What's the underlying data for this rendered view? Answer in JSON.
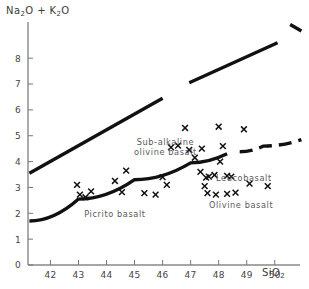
{
  "chart_data": {
    "type": "scatter",
    "title": "",
    "ylabel": "Na2O + K2O",
    "ylabel_parts": [
      "Na",
      "2",
      "O + K",
      "2",
      "O"
    ],
    "xlabel": "SiO2",
    "xlabel_parts": [
      "SiO",
      "2"
    ],
    "xlim": [
      41.2,
      50.9
    ],
    "ylim": [
      0,
      9.4
    ],
    "grid": false,
    "legend": null,
    "xticks": [
      42,
      43,
      44,
      45,
      46,
      47,
      48,
      49,
      50
    ],
    "xtick_labels": [
      "42",
      "43",
      "44",
      "45",
      "46",
      "47",
      "48",
      "49",
      "50"
    ],
    "yticks": [
      0,
      1,
      2,
      3,
      4,
      5,
      6,
      7,
      8
    ],
    "ytick_labels": [
      "0",
      "1",
      "2",
      "3",
      "4",
      "5",
      "6",
      "7",
      "8"
    ],
    "field_labels": [
      {
        "name": "sub-alkaline-olivine-basalt",
        "line1": "Sub-alkaline",
        "line2": "olivine  basalt",
        "x": 46.1,
        "y": 4.65
      },
      {
        "name": "picrito-basalt",
        "line1": "Picrito  basalt",
        "line2": "",
        "x": 44.3,
        "y": 1.85
      },
      {
        "name": "leucobasalt",
        "line1": "Leucobasalt",
        "line2": "",
        "x": 48.9,
        "y": 3.25
      },
      {
        "name": "olivine-basalt",
        "line1": "Olivine  basalt",
        "line2": "",
        "x": 48.8,
        "y": 2.2
      }
    ],
    "boundaries": [
      {
        "name": "upper-alkaline-boundary-lower",
        "style": "solid",
        "points": [
          [
            41.25,
            3.55
          ],
          [
            46.0,
            6.45
          ]
        ]
      },
      {
        "name": "upper-alkaline-boundary-upper",
        "style": "solid",
        "points": [
          [
            46.95,
            7.05
          ],
          [
            50.1,
            8.6
          ]
        ]
      },
      {
        "name": "upper-alkaline-boundary-top",
        "style": "solid",
        "points": [
          [
            50.55,
            9.3
          ],
          [
            50.95,
            9.05
          ]
        ]
      },
      {
        "name": "lower-alkaline-boundary-solid",
        "style": "solid",
        "points": [
          [
            41.25,
            1.7
          ],
          [
            43.0,
            2.55
          ],
          [
            45.0,
            3.3
          ],
          [
            47.0,
            3.95
          ],
          [
            48.3,
            4.3
          ]
        ]
      },
      {
        "name": "lower-alkaline-boundary-dashed",
        "style": "dashed",
        "points": [
          [
            48.75,
            4.38
          ],
          [
            49.6,
            4.6
          ],
          [
            50.95,
            4.85
          ]
        ]
      }
    ],
    "series": [
      {
        "name": "analyses",
        "marker": "x",
        "points": [
          [
            42.95,
            3.1
          ],
          [
            43.05,
            2.72
          ],
          [
            43.45,
            2.85
          ],
          [
            43.25,
            2.62
          ],
          [
            44.3,
            3.25
          ],
          [
            44.55,
            2.82
          ],
          [
            44.7,
            3.65
          ],
          [
            45.35,
            2.78
          ],
          [
            45.75,
            2.72
          ],
          [
            46.0,
            3.4
          ],
          [
            46.15,
            3.1
          ],
          [
            46.3,
            4.55
          ],
          [
            46.55,
            4.62
          ],
          [
            46.8,
            5.3
          ],
          [
            46.95,
            4.45
          ],
          [
            47.15,
            4.15
          ],
          [
            47.35,
            3.6
          ],
          [
            47.4,
            4.5
          ],
          [
            47.5,
            3.05
          ],
          [
            47.55,
            3.38
          ],
          [
            47.65,
            3.42
          ],
          [
            47.85,
            3.48
          ],
          [
            47.6,
            2.78
          ],
          [
            47.9,
            2.72
          ],
          [
            48.0,
            5.35
          ],
          [
            48.05,
            4.0
          ],
          [
            48.15,
            4.6
          ],
          [
            48.3,
            3.45
          ],
          [
            48.45,
            3.42
          ],
          [
            48.3,
            2.75
          ],
          [
            48.6,
            2.8
          ],
          [
            48.9,
            5.25
          ],
          [
            49.1,
            3.15
          ],
          [
            49.75,
            3.05
          ]
        ]
      }
    ]
  }
}
